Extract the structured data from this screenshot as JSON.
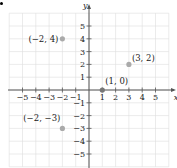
{
  "chart_data": {
    "type": "scatter",
    "title": "",
    "xlabel": "x",
    "ylabel": "y",
    "xlim": [
      -6,
      6
    ],
    "ylim": [
      -6,
      6
    ],
    "grid": true,
    "x_ticks": [
      -5,
      -4,
      -3,
      -2,
      -1,
      1,
      2,
      3,
      4,
      5
    ],
    "y_ticks": [
      5,
      4,
      3,
      2,
      1,
      -1,
      -2,
      -3,
      -4,
      -5
    ],
    "points": [
      {
        "x": -2,
        "y": 4,
        "label": "(−2, 4)"
      },
      {
        "x": 3,
        "y": 2,
        "label": "(3, 2)"
      },
      {
        "x": 1,
        "y": 0,
        "label": "(1, 0)"
      },
      {
        "x": -2,
        "y": -3,
        "label": "(−2, −3)"
      }
    ]
  },
  "colors": {
    "axis": "#555555",
    "grid": "#dddddd",
    "point": "#aaaaaa",
    "point_on_axis": "#777777",
    "text": "#222222"
  },
  "layout": {
    "origin_x": 89,
    "origin_y": 90,
    "unit_x": 13.3,
    "unit_y": 12.8
  }
}
